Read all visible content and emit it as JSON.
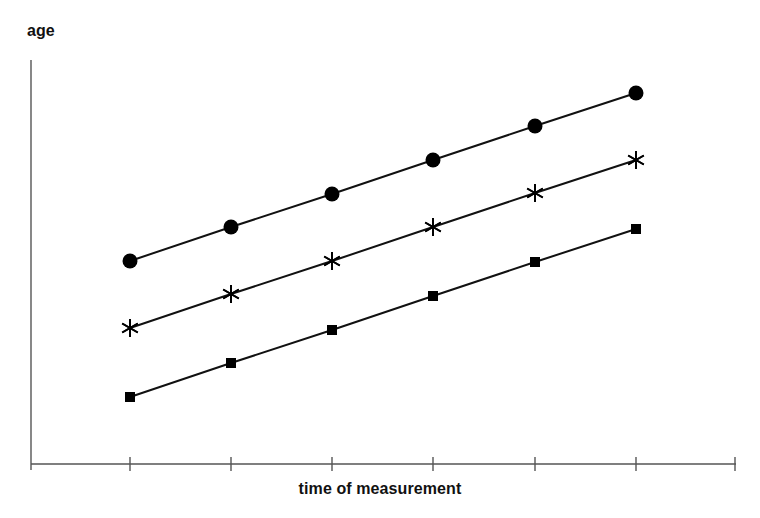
{
  "chart_data": {
    "type": "line",
    "title": "",
    "subtitle": "",
    "xlabel": "time of measurement",
    "ylabel": "age",
    "grid": false,
    "legend": false,
    "legend_position": "none",
    "x_tick_labels": [
      "",
      "",
      "",
      "",
      "",
      ""
    ],
    "y_tick_labels": [],
    "x": [
      1,
      2,
      3,
      4,
      5,
      6
    ],
    "categories": [
      "1",
      "2",
      "3",
      "4",
      "5",
      "6"
    ],
    "xlim": [
      0.5,
      6.5
    ],
    "ylim": [
      0,
      10
    ],
    "annotations": [],
    "series": [
      {
        "name": "cohort-3-oldest",
        "marker": "filled-circle",
        "color": "#000000",
        "values": [
          5.05,
          5.9,
          6.75,
          7.6,
          8.45,
          9.3
        ],
        "pixel_points": [
          {
            "x": 130,
            "y": 261
          },
          {
            "x": 231,
            "y": 227
          },
          {
            "x": 332,
            "y": 194
          },
          {
            "x": 433,
            "y": 160
          },
          {
            "x": 535,
            "y": 126
          },
          {
            "x": 636,
            "y": 93
          }
        ]
      },
      {
        "name": "cohort-2-middle",
        "marker": "six-pointed-asterisk",
        "color": "#000000",
        "values": [
          3.35,
          4.2,
          5.05,
          5.9,
          6.75,
          7.6
        ],
        "pixel_points": [
          {
            "x": 130,
            "y": 328
          },
          {
            "x": 231,
            "y": 294
          },
          {
            "x": 332,
            "y": 261
          },
          {
            "x": 433,
            "y": 227
          },
          {
            "x": 535,
            "y": 193
          },
          {
            "x": 636,
            "y": 160
          }
        ]
      },
      {
        "name": "cohort-1-youngest",
        "marker": "filled-square",
        "color": "#000000",
        "values": [
          1.6,
          2.45,
          3.3,
          4.15,
          5.0,
          5.85
        ],
        "pixel_points": [
          {
            "x": 130,
            "y": 397
          },
          {
            "x": 231,
            "y": 363
          },
          {
            "x": 332,
            "y": 330
          },
          {
            "x": 433,
            "y": 296
          },
          {
            "x": 535,
            "y": 262
          },
          {
            "x": 636,
            "y": 229
          }
        ]
      }
    ],
    "axes_geometry": {
      "y_axis_x": 31,
      "y_axis_top": 60,
      "y_axis_bottom": 470,
      "x_axis_y": 464,
      "x_axis_left": 31,
      "x_axis_right": 736,
      "tick_x_positions": [
        130,
        231,
        332,
        433,
        535,
        636,
        735
      ],
      "tick_length": 14
    },
    "style": {
      "line_color": "#111111",
      "line_width": 2,
      "axis_color": "#555555",
      "axis_width": 1.4,
      "marker_color": "#000000",
      "background": "#ffffff",
      "circle_radius": 7.5,
      "square_size": 10,
      "asterisk_radius": 9
    }
  }
}
